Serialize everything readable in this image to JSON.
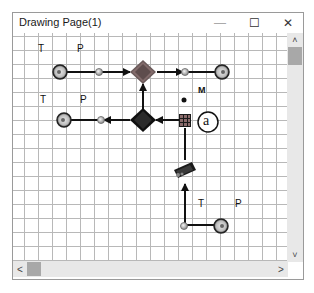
{
  "window": {
    "title": "Drawing Page(1)",
    "controls": {
      "minimize": "—",
      "maximize": "☐",
      "close": "✕"
    }
  },
  "diagram": {
    "labels": {
      "top_T": "T",
      "top_P": "P",
      "mid_T": "T",
      "mid_P": "P",
      "M": "M",
      "a": "a",
      "bottom_T": "T",
      "bottom_P": "P"
    },
    "nodes": [
      {
        "id": "gauge-top-left",
        "type": "gauge"
      },
      {
        "id": "junction-top-left",
        "type": "junction"
      },
      {
        "id": "mixer-top",
        "type": "mixer"
      },
      {
        "id": "junction-top-right",
        "type": "junction"
      },
      {
        "id": "gauge-top-right",
        "type": "gauge"
      },
      {
        "id": "gauge-mid-left",
        "type": "gauge"
      },
      {
        "id": "junction-mid-left",
        "type": "junction"
      },
      {
        "id": "mixer-mid",
        "type": "mixer"
      },
      {
        "id": "valve-block",
        "type": "valve"
      },
      {
        "id": "marker-a",
        "type": "circle-label"
      },
      {
        "id": "pump",
        "type": "pump"
      },
      {
        "id": "junction-bottom",
        "type": "junction"
      },
      {
        "id": "gauge-bottom-right",
        "type": "gauge"
      }
    ]
  },
  "scrollbars": {
    "up": "˄",
    "down": "˅",
    "left": "<",
    "right": ">"
  }
}
